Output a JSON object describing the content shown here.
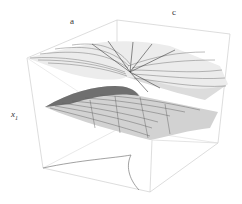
{
  "figure": {
    "labels": {
      "a": "a",
      "c": "c",
      "x_var": "x",
      "x_sub": "1"
    },
    "colors": {
      "box_edge": "#c8c8c8",
      "surface_light": "#e6e6e6",
      "surface_mid": "#bdbdbd",
      "surface_dark": "#6a6a6a",
      "mesh_line": "#5a5a5a",
      "cusp_curve": "#777777"
    }
  }
}
